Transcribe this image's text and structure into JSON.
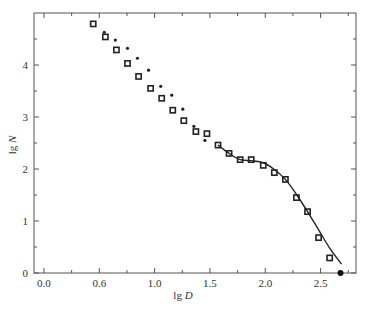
{
  "chart_data": {
    "type": "scatter",
    "title": "",
    "xlabel": {
      "prefix": "lg",
      "var": "D"
    },
    "ylabel": {
      "prefix": "lg",
      "var": "N"
    },
    "xlim": [
      -0.09,
      2.82
    ],
    "ylim": [
      0,
      5.0
    ],
    "x_ticks": [
      {
        "value": 0.0,
        "label": "0.0"
      },
      {
        "value": 0.5,
        "label": "0.6"
      },
      {
        "value": 1.0,
        "label": "1.0"
      },
      {
        "value": 1.5,
        "label": "1.5"
      },
      {
        "value": 2.0,
        "label": "2.0"
      },
      {
        "value": 2.5,
        "label": "2.5"
      }
    ],
    "x_minor_ticks": [
      0.25,
      0.75,
      1.25,
      1.75,
      2.25,
      2.75
    ],
    "y_ticks": [
      {
        "value": 0,
        "label": "0"
      },
      {
        "value": 1,
        "label": "1"
      },
      {
        "value": 2,
        "label": "2"
      },
      {
        "value": 3,
        "label": "3"
      },
      {
        "value": 4,
        "label": "4"
      }
    ],
    "y_minor_ticks": [
      0.5,
      1.5,
      2.5,
      3.5,
      4.5
    ],
    "grid": false,
    "legend": "none",
    "series": [
      {
        "name": "squares",
        "marker": "open-square",
        "x": [
          0.445,
          0.555,
          0.655,
          0.755,
          0.855,
          0.964,
          1.064,
          1.164,
          1.264,
          1.373,
          1.473,
          1.573,
          1.673,
          1.773,
          1.873,
          1.982,
          2.082,
          2.182,
          2.282,
          2.382,
          2.482,
          2.582
        ],
        "y": [
          4.79,
          4.54,
          4.29,
          4.03,
          3.78,
          3.55,
          3.36,
          3.13,
          2.93,
          2.72,
          2.68,
          2.46,
          2.3,
          2.18,
          2.18,
          2.07,
          1.93,
          1.8,
          1.45,
          1.18,
          0.68,
          0.29
        ]
      },
      {
        "name": "dots",
        "marker": "small-dot",
        "x": [
          0.545,
          0.645,
          0.755,
          0.845,
          0.945,
          1.055,
          1.155,
          1.255,
          1.355,
          1.455
        ],
        "y": [
          4.63,
          4.48,
          4.32,
          4.13,
          3.9,
          3.59,
          3.42,
          3.15,
          2.82,
          2.55
        ]
      },
      {
        "name": "endpoint",
        "marker": "filled-circle",
        "x": [
          2.68
        ],
        "y": [
          0.0
        ]
      },
      {
        "name": "fit-curve",
        "marker": "line",
        "x": [
          1.573,
          1.673,
          1.773,
          1.873,
          1.982,
          2.082,
          2.182,
          2.282,
          2.382,
          2.482,
          2.582,
          2.69
        ],
        "y": [
          2.46,
          2.3,
          2.18,
          2.16,
          2.12,
          1.99,
          1.8,
          1.51,
          1.18,
          0.83,
          0.48,
          0.17
        ]
      }
    ]
  }
}
